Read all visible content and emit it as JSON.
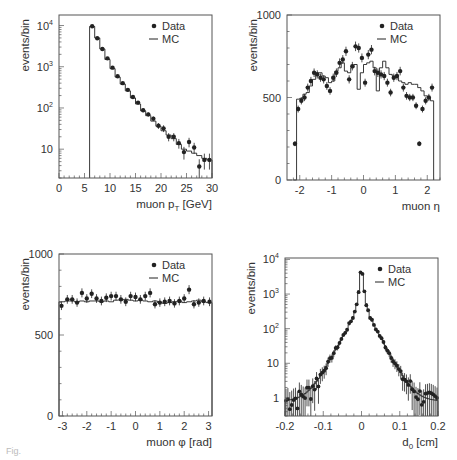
{
  "figure": {
    "caption_fragment": "Fig."
  },
  "chart_data": [
    {
      "id": "pt",
      "type": "histogram",
      "xlabel": "muon p",
      "xlabel_sub": "T",
      "xlabel_unit": " [GeV]",
      "ylabel": "events/bin",
      "xlim": [
        0,
        30
      ],
      "ylim": [
        2,
        18000
      ],
      "yscale": "log",
      "xticks": [
        0,
        5,
        10,
        15,
        20,
        25,
        30
      ],
      "xtick_labels": [
        "0",
        "5",
        "10",
        "15",
        "20",
        "25",
        "30"
      ],
      "yticks": [
        10,
        100,
        1000,
        10000
      ],
      "ytick_labels": [
        "10",
        "10²",
        "10³",
        "10⁴"
      ],
      "legend": {
        "position": "top-right",
        "entries": [
          "Data",
          "MC"
        ]
      },
      "mc": {
        "bin_edges": [
          6,
          7,
          8,
          9,
          10,
          11,
          12,
          13,
          14,
          15,
          16,
          17,
          18,
          19,
          20,
          21,
          22,
          23,
          24,
          25,
          26,
          27,
          28,
          29,
          30
        ],
        "values": [
          9500,
          5000,
          2700,
          1500,
          900,
          560,
          380,
          260,
          175,
          125,
          85,
          65,
          48,
          36,
          28,
          22,
          18,
          13,
          10,
          9,
          8,
          7,
          6,
          5.5
        ]
      },
      "data": {
        "x": [
          6.5,
          7.5,
          8.5,
          9.5,
          10.5,
          11.5,
          12.5,
          13.5,
          14.5,
          15.5,
          16.5,
          17.5,
          18.5,
          19.5,
          20.5,
          21.5,
          22.5,
          23.5,
          24.5,
          25.5,
          26.5,
          27.5,
          28.5,
          29.5
        ],
        "y": [
          9600,
          4900,
          2700,
          1600,
          950,
          590,
          400,
          275,
          185,
          135,
          88,
          70,
          55,
          37,
          32,
          20,
          20,
          14,
          8.5,
          15,
          11,
          3.8,
          5.5,
          5.5
        ],
        "err": [
          100,
          70,
          52,
          40,
          31,
          24,
          20,
          17,
          14,
          12,
          9,
          8,
          7,
          6,
          6,
          4.5,
          4.5,
          3.7,
          2.9,
          3.9,
          3.3,
          1.9,
          2.3,
          2.3
        ]
      }
    },
    {
      "id": "eta",
      "type": "histogram",
      "xlabel": "muon η",
      "ylabel": "events/bin",
      "xlim": [
        -2.4,
        2.4
      ],
      "ylim": [
        0,
        1000
      ],
      "yscale": "linear",
      "xticks": [
        -2,
        -1,
        0,
        1,
        2
      ],
      "xtick_labels": [
        "-2",
        "-1",
        "0",
        "1",
        "2"
      ],
      "yticks": [
        0,
        500,
        1000
      ],
      "ytick_labels": [
        "0",
        "500",
        "1000"
      ],
      "legend": {
        "position": "top-right",
        "entries": [
          "Data",
          "MC"
        ]
      },
      "mc": {
        "bin_edges": [
          -2.2,
          -2.1,
          -2.0,
          -1.9,
          -1.8,
          -1.7,
          -1.6,
          -1.5,
          -1.4,
          -1.3,
          -1.2,
          -1.1,
          -1.0,
          -0.9,
          -0.8,
          -0.7,
          -0.6,
          -0.5,
          -0.4,
          -0.3,
          -0.2,
          -0.1,
          0.0,
          0.1,
          0.2,
          0.3,
          0.4,
          0.5,
          0.6,
          0.7,
          0.8,
          0.9,
          1.0,
          1.1,
          1.2,
          1.3,
          1.4,
          1.5,
          1.6,
          1.7,
          1.8,
          1.9,
          2.0,
          2.1,
          2.2
        ],
        "values": [
          0,
          490,
          495,
          520,
          530,
          570,
          610,
          650,
          650,
          630,
          620,
          590,
          600,
          660,
          680,
          710,
          660,
          650,
          680,
          700,
          550,
          650,
          700,
          710,
          720,
          680,
          540,
          680,
          720,
          680,
          640,
          630,
          620,
          600,
          590,
          580,
          590,
          580,
          580,
          560,
          540,
          510,
          500,
          480
        ]
      },
      "data": {
        "x": [
          -2.15,
          -2.05,
          -1.95,
          -1.85,
          -1.75,
          -1.65,
          -1.55,
          -1.45,
          -1.35,
          -1.25,
          -1.15,
          -1.05,
          -0.95,
          -0.85,
          -0.75,
          -0.65,
          -0.55,
          -0.45,
          -0.35,
          -0.25,
          -0.15,
          -0.05,
          0.05,
          0.15,
          0.25,
          0.35,
          0.45,
          0.55,
          0.65,
          0.75,
          0.85,
          0.95,
          1.05,
          1.15,
          1.25,
          1.35,
          1.45,
          1.55,
          1.65,
          1.75,
          1.85,
          1.95,
          2.05,
          2.15
        ],
        "y": [
          220,
          430,
          480,
          500,
          560,
          600,
          650,
          640,
          620,
          610,
          570,
          540,
          620,
          650,
          710,
          730,
          780,
          610,
          690,
          810,
          800,
          740,
          590,
          760,
          790,
          660,
          650,
          640,
          630,
          590,
          530,
          620,
          630,
          660,
          560,
          510,
          500,
          500,
          450,
          220,
          430,
          480,
          500,
          560
        ],
        "err": [
          15,
          21,
          22,
          22,
          24,
          25,
          26,
          25,
          25,
          25,
          24,
          23,
          25,
          26,
          27,
          27,
          28,
          25,
          26,
          29,
          28,
          27,
          24,
          28,
          28,
          26,
          26,
          25,
          25,
          24,
          23,
          25,
          25,
          26,
          24,
          23,
          22,
          22,
          21,
          15,
          21,
          22,
          22,
          24
        ]
      }
    },
    {
      "id": "phi",
      "type": "histogram",
      "xlabel": "muon φ [rad]",
      "ylabel": "events/bin",
      "xlim": [
        -3.14159,
        3.14159
      ],
      "ylim": [
        0,
        1000
      ],
      "yscale": "linear",
      "xticks": [
        -3,
        -2,
        -1,
        0,
        1,
        2,
        3
      ],
      "xtick_labels": [
        "-3",
        "-2",
        "-1",
        "0",
        "1",
        "2",
        "3"
      ],
      "yticks": [
        0,
        500,
        1000
      ],
      "ytick_labels": [
        "0",
        "500",
        "1000"
      ],
      "legend": {
        "position": "top-right",
        "entries": [
          "Data",
          "MC"
        ]
      },
      "mc": {
        "bin_edges": [
          -3.14159,
          -2.9,
          -2.7,
          -2.5,
          -2.3,
          -2.1,
          -1.9,
          -1.7,
          -1.5,
          -1.3,
          -1.1,
          -0.9,
          -0.7,
          -0.5,
          -0.3,
          -0.1,
          0.1,
          0.3,
          0.5,
          0.7,
          0.9,
          1.1,
          1.3,
          1.5,
          1.7,
          1.9,
          2.1,
          2.3,
          2.5,
          2.7,
          2.9,
          3.14159
        ],
        "values": [
          705,
          710,
          710,
          705,
          710,
          705,
          710,
          710,
          705,
          710,
          705,
          715,
          715,
          720,
          715,
          710,
          715,
          710,
          705,
          710,
          700,
          695,
          700,
          705,
          710,
          700,
          705,
          710,
          715,
          705,
          700
        ]
      },
      "data": {
        "x": [
          -3.04,
          -2.8,
          -2.6,
          -2.4,
          -2.2,
          -2.0,
          -1.8,
          -1.6,
          -1.4,
          -1.2,
          -1.0,
          -0.8,
          -0.6,
          -0.4,
          -0.2,
          0.0,
          0.2,
          0.4,
          0.6,
          0.8,
          1.0,
          1.2,
          1.4,
          1.6,
          1.8,
          2.0,
          2.2,
          2.4,
          2.6,
          2.8,
          3.04
        ],
        "y": [
          680,
          720,
          720,
          700,
          760,
          725,
          755,
          725,
          710,
          730,
          740,
          740,
          720,
          705,
          740,
          735,
          720,
          740,
          760,
          690,
          700,
          705,
          710,
          695,
          710,
          725,
          780,
          690,
          700,
          710,
          705
        ],
        "err": [
          26,
          27,
          27,
          26,
          28,
          27,
          27,
          27,
          27,
          27,
          27,
          27,
          27,
          27,
          27,
          27,
          27,
          27,
          28,
          26,
          26,
          27,
          27,
          26,
          27,
          27,
          28,
          26,
          26,
          27,
          27
        ]
      }
    },
    {
      "id": "d0",
      "type": "histogram",
      "xlabel": "d",
      "xlabel_sub": "0",
      "xlabel_unit": " [cm]",
      "ylabel": "events/bin",
      "xlim": [
        -0.2,
        0.2
      ],
      "ylim": [
        0.3,
        11000
      ],
      "yscale": "log",
      "xticks": [
        -0.2,
        -0.1,
        0,
        0.1,
        0.2
      ],
      "xtick_labels": [
        "-0.2",
        "-0.1",
        "0",
        "0.1",
        "0.2"
      ],
      "yticks": [
        1,
        10,
        100,
        1000,
        10000
      ],
      "ytick_labels": [
        "1",
        "10",
        "10²",
        "10³",
        "10⁴"
      ],
      "legend": {
        "position": "top-right",
        "entries": [
          "Data",
          "MC"
        ]
      },
      "peak_value": 7000,
      "core_width_cm": 0.025
    }
  ]
}
